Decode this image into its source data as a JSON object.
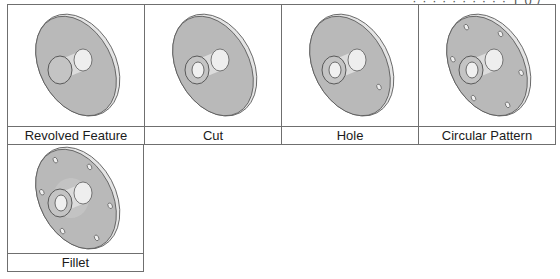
{
  "header": {
    "partial_text": "· · · · ·  · · ·  ·  · 1 0 /"
  },
  "colors": {
    "border": "#6f6f6f",
    "disc": "#b9b9b9",
    "rim": "#e4e4e4",
    "boss": "#d6d6d6",
    "outline": "#5a5a5a"
  },
  "cells": [
    {
      "label": "Revolved Feature",
      "feature": "revolved",
      "hole": false,
      "pattern_holes": 0,
      "bore": false
    },
    {
      "label": "Cut",
      "feature": "cut",
      "hole": false,
      "pattern_holes": 0,
      "bore": true
    },
    {
      "label": "Hole",
      "feature": "hole",
      "hole": true,
      "pattern_holes": 1,
      "bore": true
    },
    {
      "label": "Circular Pattern",
      "feature": "circular-pattern",
      "hole": true,
      "pattern_holes": 6,
      "bore": true
    },
    {
      "label": "Fillet",
      "feature": "fillet",
      "hole": true,
      "pattern_holes": 6,
      "bore": true
    }
  ]
}
